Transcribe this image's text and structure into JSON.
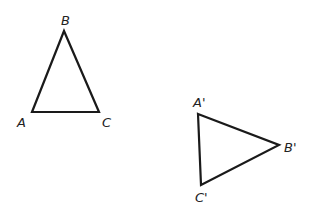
{
  "diagram": {
    "type": "geometry-transformation",
    "stroke_color": "#1a1a1a",
    "triangles": [
      {
        "name": "original",
        "vertices": [
          {
            "label": "A",
            "x": 32,
            "y": 112
          },
          {
            "label": "B",
            "x": 64,
            "y": 31
          },
          {
            "label": "C",
            "x": 99,
            "y": 112
          }
        ]
      },
      {
        "name": "image",
        "vertices": [
          {
            "label": "A'",
            "x": 198,
            "y": 114
          },
          {
            "label": "B'",
            "x": 279,
            "y": 145
          },
          {
            "label": "C'",
            "x": 201,
            "y": 185
          }
        ]
      }
    ],
    "labels": {
      "A": "A",
      "B": "B",
      "C": "C",
      "A_prime": "A'",
      "B_prime": "B'",
      "C_prime": "C'"
    }
  }
}
